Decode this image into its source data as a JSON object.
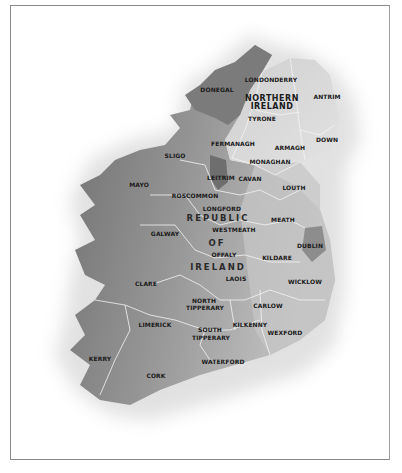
{
  "map": {
    "title": "Ireland county map",
    "colors": {
      "republic_dark": "#7d7d7d",
      "republic_mid": "#a3a3a3",
      "northern_ireland": "#d2d2d2",
      "border_lines": "#f2f2f2",
      "frame": "#8a8a8a",
      "label": "#1a1a1a"
    },
    "regions": {
      "northern_ireland": [
        "NORTHERN",
        "IRELAND"
      ],
      "republic": [
        "REPUBLIC",
        "OF",
        "IRELAND"
      ]
    },
    "counties": {
      "donegal": "DONEGAL",
      "londonderry": "LONDONDERRY",
      "antrim": "ANTRIM",
      "tyrone": "TYRONE",
      "down": "DOWN",
      "fermanagh": "FERMANAGH",
      "armagh": "ARMAGH",
      "sligo": "SLIGO",
      "monaghan": "MONAGHAN",
      "leitrim": "LEITRIM",
      "cavan": "CAVAN",
      "mayo": "MAYO",
      "roscommon": "ROSCOMMON",
      "louth": "LOUTH",
      "longford": "LONGFORD",
      "meath": "MEATH",
      "westmeath": "WESTMEATH",
      "galway": "GALWAY",
      "dublin": "DUBLIN",
      "offaly": "OFFALY",
      "kildare": "KILDARE",
      "clare": "CLARE",
      "laois": "LAOIS",
      "wicklow": "WICKLOW",
      "north_tipperary": [
        "NORTH",
        "TIPPERARY"
      ],
      "carlow": "CARLOW",
      "limerick": "LIMERICK",
      "kilkenny": "KILKENNY",
      "south_tipperary": [
        "SOUTH",
        "TIPPERARY"
      ],
      "wexford": "WEXFORD",
      "kerry": "KERRY",
      "waterford": "WATERFORD",
      "cork": "CORK"
    }
  }
}
